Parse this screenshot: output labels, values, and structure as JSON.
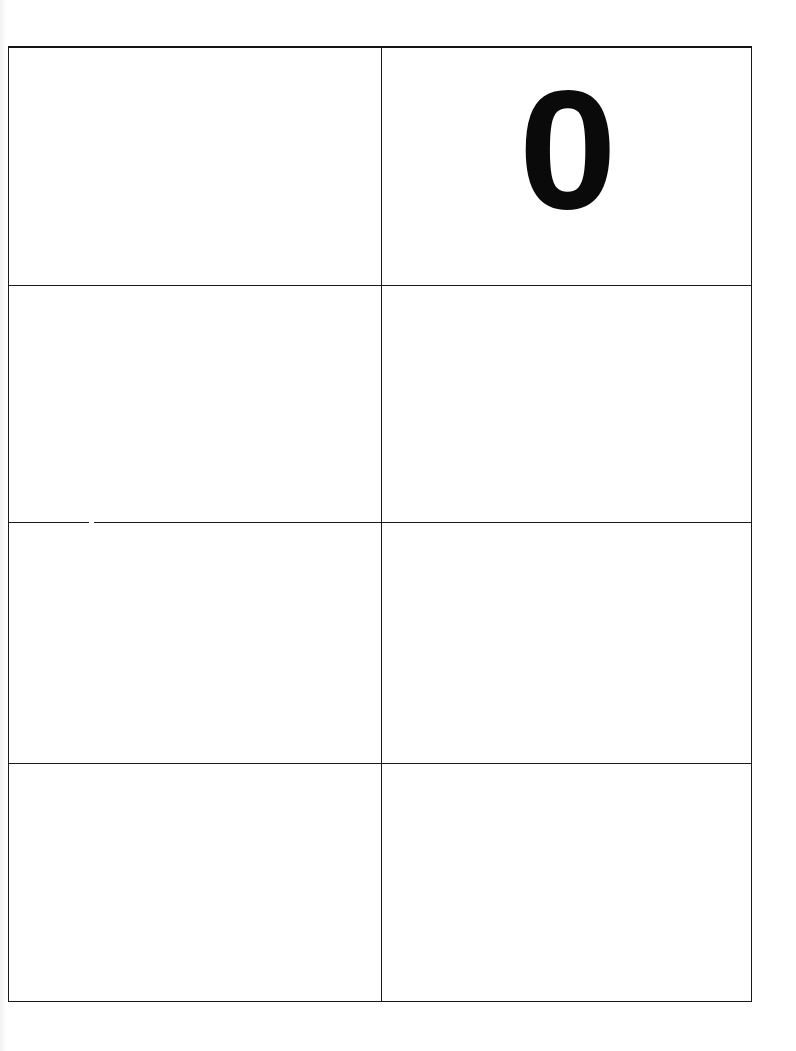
{
  "document": {
    "type": "printed grid worksheet",
    "layout": {
      "rows": 4,
      "columns": 2
    },
    "cells": [
      {
        "row": 1,
        "col": 1,
        "text": ""
      },
      {
        "row": 1,
        "col": 2,
        "text": "0"
      },
      {
        "row": 2,
        "col": 1,
        "text": ""
      },
      {
        "row": 2,
        "col": 2,
        "text": ""
      },
      {
        "row": 3,
        "col": 1,
        "text": ""
      },
      {
        "row": 3,
        "col": 2,
        "text": ""
      },
      {
        "row": 4,
        "col": 1,
        "text": ""
      },
      {
        "row": 4,
        "col": 2,
        "text": ""
      }
    ],
    "colors": {
      "ink": "#0a0a0a",
      "background": "#ffffff"
    }
  }
}
